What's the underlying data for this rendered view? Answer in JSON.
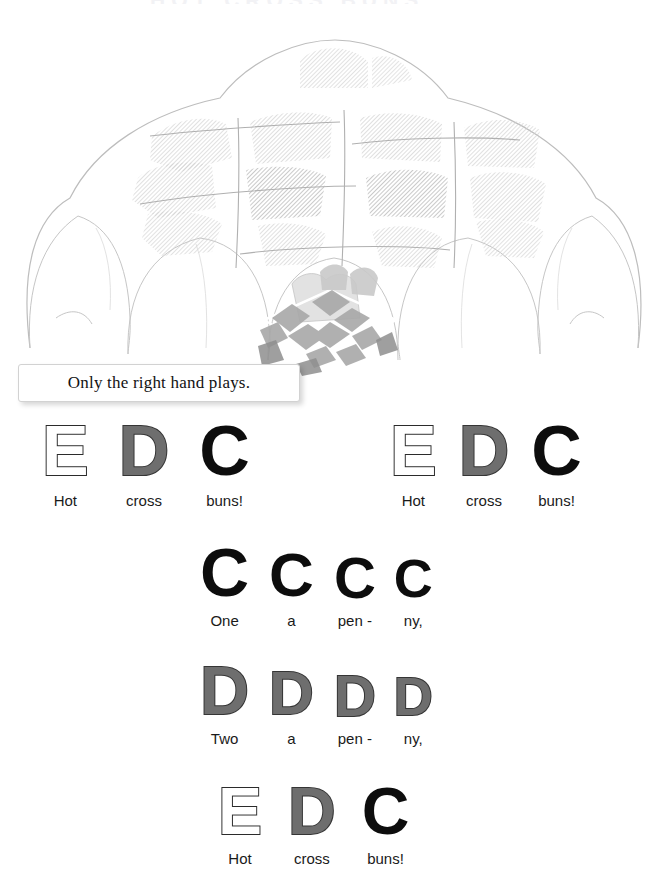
{
  "page": {
    "background": "#ffffff",
    "width": 665,
    "height": 890,
    "header_remnant": "HOT CROSS BUNS"
  },
  "illustration": {
    "name": "hot-cross-buns-illustration",
    "description": "Faded watercolor drawing of a pile of hot cross buns",
    "ink_color": "#b9b9b9",
    "wash_color": "#d9d9d9",
    "accent_color": "#9a9a9a"
  },
  "caption": {
    "text": "Only the right hand plays.",
    "border_color": "#d2d2d2",
    "background": "#ffffff",
    "text_color": "#121212"
  },
  "legend": {
    "note_styles": {
      "C": {
        "style": "solid",
        "fill": "#0d0d0d",
        "stroke": "#0d0d0d"
      },
      "D": {
        "style": "gray",
        "fill": "#6e6e6e",
        "stroke": "#353535"
      },
      "E": {
        "style": "outline",
        "fill": "#ffffff",
        "stroke": "#2b2b2b"
      }
    }
  },
  "staves": [
    {
      "name": "line-1-phrase-a",
      "left": 42,
      "top": 418,
      "notes": [
        {
          "note": "E",
          "lyric": "Hot",
          "size": 70,
          "gap": 30
        },
        {
          "note": "D",
          "lyric": "cross",
          "size": 70,
          "gap": 30
        },
        {
          "note": "C",
          "lyric": "buns!",
          "size": 70,
          "gap": 0
        }
      ]
    },
    {
      "name": "line-1-phrase-b",
      "left": 390,
      "top": 418,
      "notes": [
        {
          "note": "E",
          "lyric": "Hot",
          "size": 70,
          "gap": 22
        },
        {
          "note": "D",
          "lyric": "cross",
          "size": 70,
          "gap": 22
        },
        {
          "note": "C",
          "lyric": "buns!",
          "size": 70,
          "gap": 0
        }
      ]
    },
    {
      "name": "line-2-one-a-penny",
      "left": 200,
      "top": 540,
      "notes": [
        {
          "note": "C",
          "lyric": "One",
          "size": 68,
          "gap": 20
        },
        {
          "note": "C",
          "lyric": "a",
          "size": 62,
          "gap": 20
        },
        {
          "note": "C",
          "lyric": "pen -",
          "size": 58,
          "gap": 18
        },
        {
          "note": "C",
          "lyric": "ny,",
          "size": 54,
          "gap": 0
        }
      ]
    },
    {
      "name": "line-3-two-a-penny",
      "left": 200,
      "top": 658,
      "notes": [
        {
          "note": "D",
          "lyric": "Two",
          "size": 68,
          "gap": 20
        },
        {
          "note": "D",
          "lyric": "a",
          "size": 62,
          "gap": 20
        },
        {
          "note": "D",
          "lyric": "pen -",
          "size": 58,
          "gap": 18
        },
        {
          "note": "D",
          "lyric": "ny,",
          "size": 54,
          "gap": 0
        }
      ]
    },
    {
      "name": "line-4-hot-cross-buns",
      "left": 218,
      "top": 780,
      "notes": [
        {
          "note": "E",
          "lyric": "Hot",
          "size": 66,
          "gap": 26
        },
        {
          "note": "D",
          "lyric": "cross",
          "size": 66,
          "gap": 26
        },
        {
          "note": "C",
          "lyric": "buns!",
          "size": 66,
          "gap": 0
        }
      ]
    }
  ]
}
